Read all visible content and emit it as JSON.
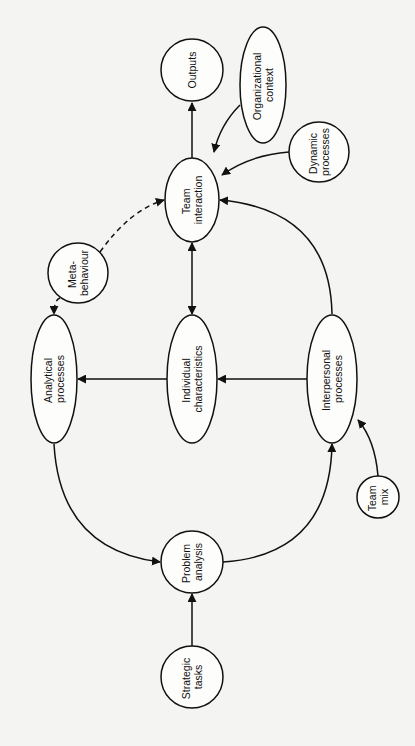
{
  "diagram": {
    "orientation": "rotated -90deg",
    "nodes": [
      {
        "id": "outputs",
        "lines": [
          "Outputs"
        ]
      },
      {
        "id": "organizational_context",
        "lines": [
          "Organizational",
          "context"
        ]
      },
      {
        "id": "dynamic_processes",
        "lines": [
          "Dynamic",
          "processes"
        ]
      },
      {
        "id": "team_interaction",
        "lines": [
          "Team",
          "interaction"
        ]
      },
      {
        "id": "meta_behaviour",
        "lines": [
          "Meta-",
          "behaviour"
        ]
      },
      {
        "id": "analytical_processes",
        "lines": [
          "Analytical",
          "processes"
        ]
      },
      {
        "id": "individual_characteristics",
        "lines": [
          "Individual",
          "characteristics"
        ]
      },
      {
        "id": "interpersonal_processes",
        "lines": [
          "Interpersonal",
          "processes"
        ]
      },
      {
        "id": "team_mix",
        "lines": [
          "Team",
          "mix"
        ]
      },
      {
        "id": "problem_analysis",
        "lines": [
          "Problem",
          "analysis"
        ]
      },
      {
        "id": "strategic_tasks",
        "lines": [
          "Strategic",
          "tasks"
        ]
      }
    ],
    "edges": [
      {
        "from": "team_interaction",
        "to": "outputs",
        "style": "solid"
      },
      {
        "from": "organizational_context",
        "to": "team_interaction",
        "style": "solid"
      },
      {
        "from": "dynamic_processes",
        "to": "team_interaction",
        "style": "solid"
      },
      {
        "from": "meta_behaviour",
        "to": "team_interaction",
        "style": "dashed"
      },
      {
        "from": "meta_behaviour",
        "to": "analytical_processes",
        "style": "dashed"
      },
      {
        "from": "individual_characteristics",
        "to": "team_interaction",
        "style": "solid",
        "bidirectional": true
      },
      {
        "from": "individual_characteristics",
        "to": "analytical_processes",
        "style": "solid"
      },
      {
        "from": "interpersonal_processes",
        "to": "individual_characteristics",
        "style": "solid"
      },
      {
        "from": "interpersonal_processes",
        "to": "team_interaction",
        "style": "solid"
      },
      {
        "from": "team_mix",
        "to": "interpersonal_processes",
        "style": "solid"
      },
      {
        "from": "analytical_processes",
        "to": "problem_analysis",
        "style": "solid"
      },
      {
        "from": "problem_analysis",
        "to": "interpersonal_processes",
        "style": "solid"
      },
      {
        "from": "strategic_tasks",
        "to": "problem_analysis",
        "style": "solid"
      }
    ]
  }
}
